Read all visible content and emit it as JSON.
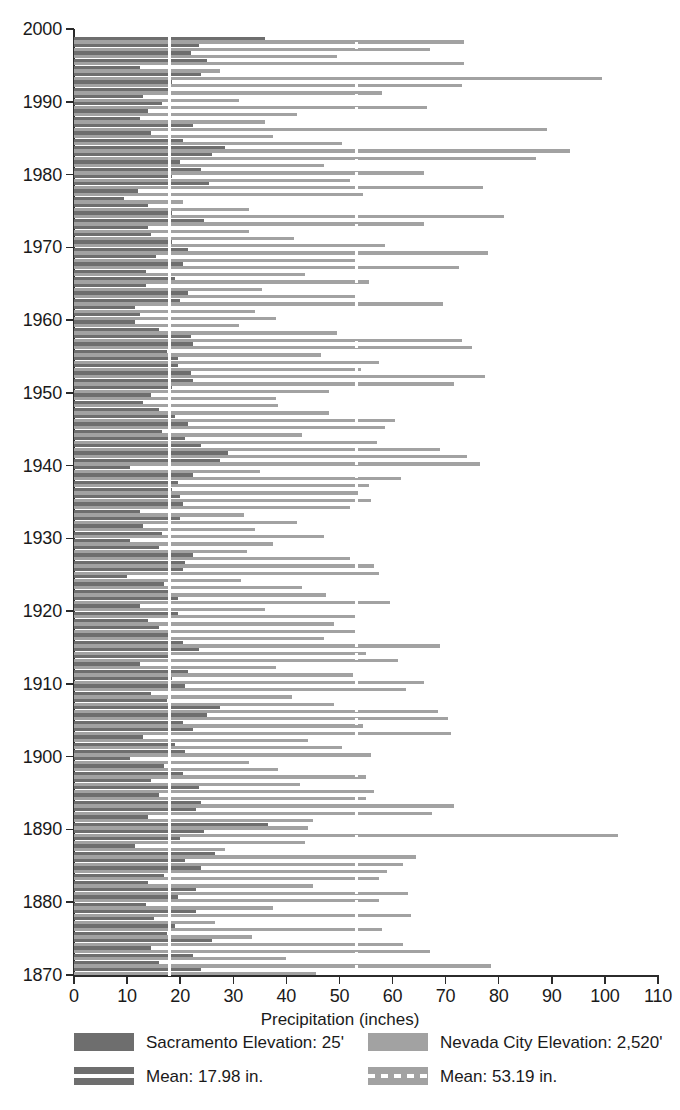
{
  "chart_data": {
    "type": "bar",
    "orientation": "horizontal",
    "title": "",
    "xlabel": "Precipitation (inches)",
    "ylabel": "",
    "xlim": [
      0,
      110
    ],
    "ylim": [
      1869,
      2000
    ],
    "grid": false,
    "legend_position": "bottom",
    "xticks": [
      0,
      10,
      20,
      30,
      40,
      50,
      60,
      70,
      80,
      90,
      100,
      110
    ],
    "yticks": [
      1870,
      1880,
      1890,
      1900,
      1910,
      1920,
      1930,
      1940,
      1950,
      1960,
      1970,
      1980,
      1990,
      2000
    ],
    "series": [
      {
        "name": "Sacramento Elevation: 25'",
        "color": "#6e6e6e",
        "mean": 17.98,
        "mean_label": "Mean: 17.98 in.",
        "mean_line_style": "solid",
        "mean_line_color": "#ffffff"
      },
      {
        "name": "Nevada City Elevation: 2,520'",
        "color": "#a2a2a2",
        "mean": 53.19,
        "mean_label": "Mean: 53.19 in.",
        "mean_line_style": "dashed",
        "mean_line_color": "#ffffff"
      }
    ],
    "years": [
      1870,
      1871,
      1872,
      1873,
      1874,
      1875,
      1876,
      1877,
      1878,
      1879,
      1880,
      1881,
      1882,
      1883,
      1884,
      1885,
      1886,
      1887,
      1888,
      1889,
      1890,
      1891,
      1892,
      1893,
      1894,
      1895,
      1896,
      1897,
      1898,
      1899,
      1900,
      1901,
      1902,
      1903,
      1904,
      1905,
      1906,
      1907,
      1908,
      1909,
      1910,
      1911,
      1912,
      1913,
      1914,
      1915,
      1916,
      1917,
      1918,
      1919,
      1920,
      1921,
      1922,
      1923,
      1924,
      1925,
      1926,
      1927,
      1928,
      1929,
      1930,
      1931,
      1932,
      1933,
      1934,
      1935,
      1936,
      1937,
      1938,
      1939,
      1940,
      1941,
      1942,
      1943,
      1944,
      1945,
      1946,
      1947,
      1948,
      1949,
      1950,
      1951,
      1952,
      1953,
      1954,
      1955,
      1956,
      1957,
      1958,
      1959,
      1960,
      1961,
      1962,
      1963,
      1964,
      1965,
      1966,
      1967,
      1968,
      1969,
      1970,
      1971,
      1972,
      1973,
      1974,
      1975,
      1976,
      1977,
      1978,
      1979,
      1980,
      1981,
      1982,
      1983,
      1984,
      1985,
      1986,
      1987,
      1988,
      1989,
      1990,
      1991,
      1992,
      1993,
      1994,
      1995,
      1996,
      1997,
      1998
    ],
    "sacramento_values": [
      24.0,
      16.0,
      22.5,
      14.5,
      26.0,
      17.5,
      19.0,
      15.0,
      23.0,
      13.5,
      19.5,
      23.0,
      14.0,
      17.0,
      24.0,
      21.0,
      26.5,
      11.5,
      20.0,
      24.5,
      36.5,
      14.0,
      23.0,
      24.0,
      16.0,
      23.5,
      14.5,
      20.5,
      17.0,
      10.5,
      21.0,
      19.0,
      13.0,
      22.5,
      20.5,
      25.0,
      27.5,
      17.5,
      14.5,
      21.0,
      18.5,
      21.5,
      12.5,
      18.0,
      23.5,
      20.5,
      18.0,
      16.0,
      14.0,
      19.5,
      12.5,
      19.5,
      18.0,
      17.0,
      10.0,
      20.5,
      21.0,
      22.5,
      16.0,
      10.5,
      16.5,
      13.0,
      20.0,
      12.5,
      20.5,
      20.0,
      18.5,
      19.5,
      22.5,
      10.5,
      27.5,
      29.0,
      24.0,
      21.0,
      16.5,
      21.5,
      19.0,
      16.0,
      13.0,
      14.5,
      18.5,
      22.5,
      22.0,
      19.5,
      19.5,
      17.5,
      22.5,
      22.0,
      16.0,
      11.5,
      12.5,
      11.5,
      20.0,
      21.5,
      13.5,
      19.0,
      13.5,
      20.5,
      15.5,
      21.5,
      18.5,
      14.5,
      14.0,
      24.5,
      18.5,
      14.0,
      9.5,
      12.0,
      25.5,
      18.5,
      24.0,
      20.0,
      26.0,
      28.5,
      20.5,
      14.5,
      22.5,
      12.5,
      14.0,
      16.5,
      13.0,
      18.0,
      18.5,
      24.0,
      12.5,
      25.0,
      22.0,
      23.5,
      36.0
    ],
    "nevada_city_values": [
      45.5,
      78.5,
      40.0,
      67.0,
      62.0,
      33.5,
      58.0,
      26.5,
      63.5,
      37.5,
      57.5,
      63.0,
      45.0,
      57.5,
      59.0,
      62.0,
      64.5,
      28.5,
      43.5,
      102.5,
      44.0,
      45.0,
      67.5,
      71.5,
      55.0,
      56.5,
      42.5,
      55.0,
      38.5,
      33.0,
      56.0,
      50.5,
      44.0,
      71.0,
      54.5,
      70.5,
      68.5,
      49.0,
      41.0,
      62.5,
      66.0,
      52.5,
      38.0,
      61.0,
      55.0,
      69.0,
      47.0,
      53.5,
      49.0,
      53.0,
      36.0,
      59.5,
      47.5,
      43.0,
      31.5,
      57.5,
      56.5,
      52.0,
      32.5,
      37.5,
      47.0,
      34.0,
      42.0,
      32.0,
      52.0,
      56.0,
      53.5,
      55.5,
      61.5,
      35.0,
      76.5,
      74.0,
      69.0,
      57.0,
      43.0,
      58.5,
      60.5,
      48.0,
      38.5,
      38.0,
      48.0,
      71.5,
      77.5,
      54.0,
      57.5,
      46.5,
      75.0,
      73.0,
      49.5,
      31.0,
      38.0,
      34.0,
      69.5,
      53.0,
      35.5,
      55.5,
      43.5,
      72.5,
      53.0,
      78.0,
      58.5,
      41.5,
      33.0,
      66.0,
      81.0,
      33.0,
      20.5,
      54.5,
      77.0,
      52.0,
      66.0,
      47.0,
      87.0,
      93.5,
      50.5,
      37.5,
      89.0,
      36.0,
      42.0,
      66.5,
      31.0,
      58.0,
      73.0,
      99.5,
      27.5,
      73.5,
      49.5,
      67.0,
      73.5
    ]
  },
  "axis": {
    "x_title": "Precipitation (inches)"
  },
  "legend": {
    "entries": [
      {
        "label": "Sacramento Elevation: 25'",
        "swatch": "sac"
      },
      {
        "label": "Nevada City Elevation: 2,520'",
        "swatch": "nev"
      },
      {
        "label": "Mean: 17.98 in.",
        "swatch": "mean-sac"
      },
      {
        "label": "Mean: 53.19 in.",
        "swatch": "mean-nev"
      }
    ]
  }
}
